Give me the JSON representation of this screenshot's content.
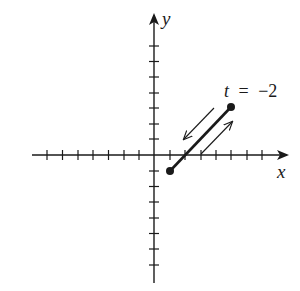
{
  "diagram": {
    "type": "parametric-curve-plot",
    "axes": {
      "x_label": "x",
      "y_label": "y",
      "x_ticks": [
        -7,
        -6,
        -5,
        -4,
        -3,
        -2,
        -1,
        1,
        2,
        3,
        4,
        5,
        6,
        7
      ],
      "y_ticks": [
        -7,
        -6,
        -5,
        -4,
        -3,
        -2,
        -1,
        1,
        2,
        3,
        4,
        5,
        6,
        7
      ]
    },
    "segment": {
      "start": [
        1,
        -1
      ],
      "end": [
        5,
        3
      ],
      "endpoint_label": {
        "var": "t",
        "eq": "=",
        "value": "−2"
      }
    },
    "direction_arrows": [
      {
        "direction": "toward lower-left",
        "side": "above segment"
      },
      {
        "direction": "toward upper-right",
        "side": "below segment"
      }
    ],
    "colors": {
      "ink": "#1a1a1a",
      "background": "#ffffff"
    }
  }
}
